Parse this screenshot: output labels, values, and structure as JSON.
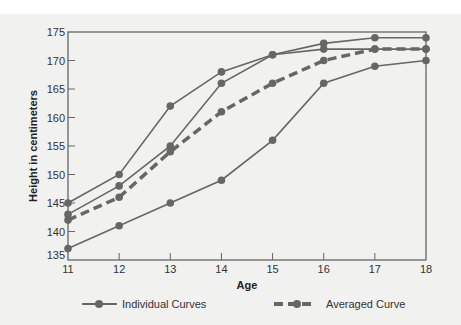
{
  "chart_data": {
    "type": "line",
    "title": "",
    "xlabel": "Age",
    "ylabel": "Height in centimeters",
    "x": [
      11,
      12,
      13,
      14,
      15,
      16,
      17,
      18
    ],
    "xlim": [
      11,
      18
    ],
    "ylim": [
      135,
      175
    ],
    "xticks": [
      11,
      12,
      13,
      14,
      15,
      16,
      17,
      18
    ],
    "yticks": [
      135,
      140,
      145,
      150,
      155,
      160,
      165,
      170,
      175
    ],
    "grid": false,
    "legend_position": "bottom",
    "series": [
      {
        "name": "Individual Curves",
        "style": "solid",
        "values": [
          145,
          150,
          162,
          168,
          171,
          172,
          172,
          172
        ]
      },
      {
        "name": "Individual Curves",
        "style": "solid",
        "values": [
          143,
          148,
          155,
          166,
          171,
          173,
          174,
          174
        ]
      },
      {
        "name": "Individual Curves",
        "style": "solid",
        "values": [
          137,
          141,
          145,
          149,
          156,
          166,
          169,
          170
        ]
      },
      {
        "name": "Averaged Curve",
        "style": "dashed",
        "values": [
          142,
          146,
          154,
          161,
          166,
          170,
          172,
          172
        ]
      }
    ],
    "legend": [
      "Individual Curves",
      "Averaged Curve"
    ]
  },
  "colors": {
    "line": "#666666",
    "background": "#f1f1f0",
    "axis": "#666666"
  }
}
